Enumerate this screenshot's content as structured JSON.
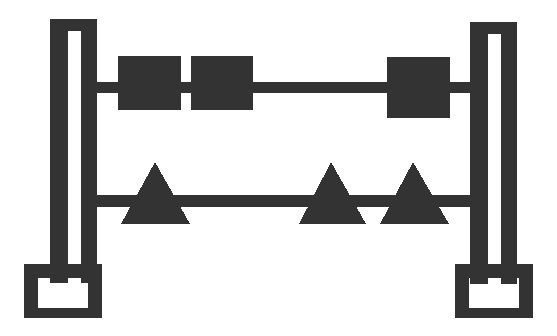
{
  "canvas": {
    "width": 557,
    "height": 336,
    "background_color": "#ffffff",
    "ink_color": "#333333",
    "title": "Abstract gantry figure with squares and triangles"
  },
  "figure": {
    "name": "gantry-figure",
    "stroke_color": "#333333"
  },
  "posts": [
    {
      "id": "left-post",
      "label": "Left inverted-U post",
      "outer": {
        "x": 50,
        "y": 19,
        "width": 47,
        "height": 264
      },
      "slot": {
        "x": 68,
        "y": 31,
        "width": 13,
        "height": 252
      },
      "base": {
        "x": 24,
        "y": 264,
        "width": 78,
        "height": 54
      },
      "base_hole": {
        "x": 38,
        "y": 278,
        "width": 50,
        "height": 30
      }
    },
    {
      "id": "right-post",
      "label": "Right inverted-U post",
      "outer": {
        "x": 470,
        "y": 22,
        "width": 47,
        "height": 262
      },
      "slot": {
        "x": 488,
        "y": 34,
        "width": 13,
        "height": 250
      },
      "base": {
        "x": 455,
        "y": 264,
        "width": 78,
        "height": 54
      },
      "base_hole": {
        "x": 469,
        "y": 278,
        "width": 50,
        "height": 30
      }
    }
  ],
  "rails": [
    {
      "id": "upper-rail",
      "label": "Upper horizontal rail",
      "x": 81,
      "y": 82,
      "width": 407,
      "height": 11
    },
    {
      "id": "lower-rail",
      "label": "Lower horizontal rail",
      "x": 81,
      "y": 195,
      "width": 407,
      "height": 12
    }
  ],
  "squares": [
    {
      "id": "square-1",
      "label": "Square weight 1",
      "x": 118,
      "y": 56,
      "width": 63,
      "height": 54
    },
    {
      "id": "square-2",
      "label": "Square weight 2",
      "x": 191,
      "y": 56,
      "width": 62,
      "height": 54
    },
    {
      "id": "square-3",
      "label": "Square weight 3",
      "x": 387,
      "y": 57,
      "width": 63,
      "height": 61
    }
  ],
  "triangles": [
    {
      "id": "triangle-1",
      "label": "Triangle weight 1",
      "apex_x": 155,
      "apex_y": 162,
      "left_x": 121,
      "right_x": 190,
      "base_y": 224
    },
    {
      "id": "triangle-2",
      "label": "Triangle weight 2",
      "apex_x": 331,
      "apex_y": 162,
      "left_x": 299,
      "right_x": 366,
      "base_y": 224
    },
    {
      "id": "triangle-3",
      "label": "Triangle weight 3",
      "apex_x": 413,
      "apex_y": 162,
      "left_x": 380,
      "right_x": 449,
      "base_y": 224
    }
  ],
  "counts": {
    "posts": 2,
    "rails": 2,
    "squares": 3,
    "triangles": 3
  }
}
